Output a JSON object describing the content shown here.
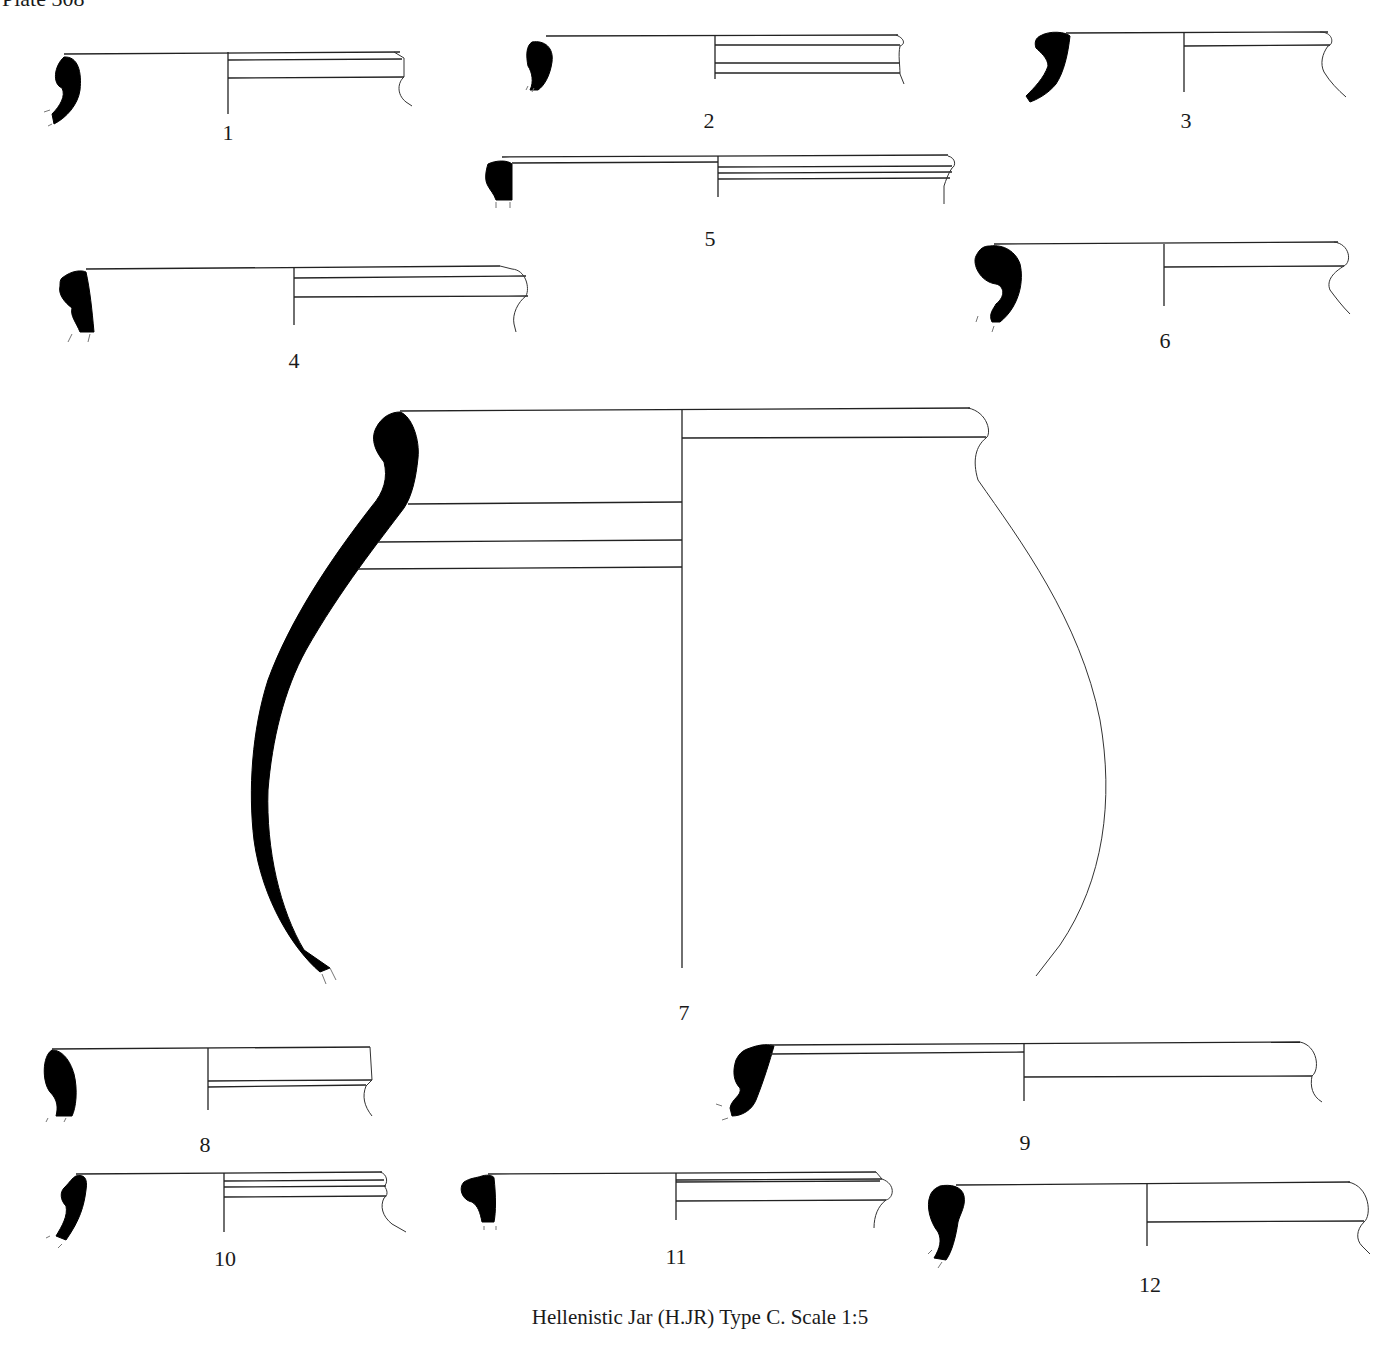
{
  "plate": {
    "title": "Plate 308"
  },
  "caption": "Hellenistic Jar (H.JR) Type C. Scale 1:5",
  "figures": [
    {
      "number": "1",
      "description": "rim profile section"
    },
    {
      "number": "2",
      "description": "rim profile section"
    },
    {
      "number": "3",
      "description": "rim profile section"
    },
    {
      "number": "4",
      "description": "rim profile section"
    },
    {
      "number": "5",
      "description": "rim profile section"
    },
    {
      "number": "6",
      "description": "rim profile section"
    },
    {
      "number": "7",
      "description": "complete upper jar profile"
    },
    {
      "number": "8",
      "description": "rim profile section"
    },
    {
      "number": "9",
      "description": "rim profile section"
    },
    {
      "number": "10",
      "description": "rim profile section"
    },
    {
      "number": "11",
      "description": "rim profile section"
    },
    {
      "number": "12",
      "description": "rim profile section"
    }
  ],
  "colors": {
    "section_fill": "#000000",
    "line": "#222222",
    "background": "#ffffff"
  }
}
